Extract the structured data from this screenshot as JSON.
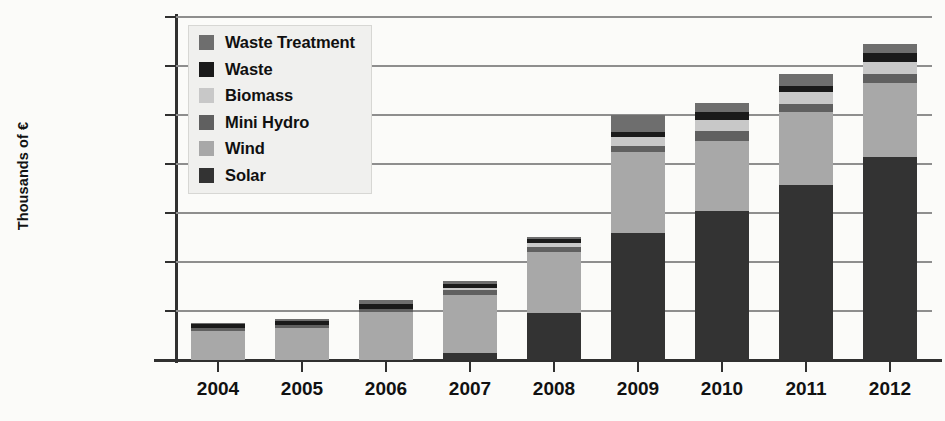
{
  "chart_data": {
    "type": "bar",
    "subtype": "stacked-vertical",
    "title": "",
    "xlabel": "",
    "ylabel": "Thousands of €",
    "categories": [
      "2004",
      "2005",
      "2006",
      "2007",
      "2008",
      "2009",
      "2010",
      "2011",
      "2012"
    ],
    "ylim": [
      0,
      7000000
    ],
    "ytick_values": [
      0,
      1000000,
      2000000,
      3000000,
      4000000,
      5000000,
      6000000,
      7000000
    ],
    "ytick_labels": [
      "0",
      "1000000",
      "2000000",
      "3000000",
      "4000000",
      "5000000",
      "6000000",
      "7000000"
    ],
    "grid": true,
    "grid_axis": "y",
    "legend_position": "upper-left-inside",
    "stack_order_bottom_to_top": [
      "Solar",
      "Wind",
      "Mini Hydro",
      "Biomass",
      "Waste",
      "Waste Treatment"
    ],
    "series": [
      {
        "name": "Solar",
        "color": "#333333",
        "values": [
          0,
          0,
          0,
          150000,
          950000,
          2600000,
          3050000,
          3570000,
          4150000
        ]
      },
      {
        "name": "Wind",
        "color": "#a8a8a8",
        "values": [
          590000,
          660000,
          980000,
          1170000,
          1260000,
          1650000,
          1420000,
          1490000,
          1500000
        ]
      },
      {
        "name": "Mini Hydro",
        "color": "#606060",
        "values": [
          60000,
          60000,
          70000,
          100000,
          100000,
          120000,
          200000,
          160000,
          180000
        ]
      },
      {
        "name": "Biomass",
        "color": "#c8c8c8",
        "values": [
          0,
          0,
          0,
          60000,
          70000,
          180000,
          220000,
          250000,
          250000
        ]
      },
      {
        "name": "Waste",
        "color": "#1a1a1a",
        "values": [
          80000,
          80000,
          90000,
          80000,
          90000,
          100000,
          180000,
          120000,
          190000
        ]
      },
      {
        "name": "Waste Treatment",
        "color": "#6e6e6e",
        "values": [
          30000,
          40000,
          80000,
          60000,
          50000,
          350000,
          180000,
          240000,
          180000
        ]
      }
    ],
    "totals": [
      760000,
      840000,
      1220000,
      1620000,
      2520000,
      5000000,
      5250000,
      5830000,
      6450000
    ]
  },
  "legend": {
    "items": [
      {
        "label": "Waste Treatment",
        "color": "#6e6e6e"
      },
      {
        "label": "Waste",
        "color": "#1a1a1a"
      },
      {
        "label": "Biomass",
        "color": "#c8c8c8"
      },
      {
        "label": "Mini Hydro",
        "color": "#606060"
      },
      {
        "label": "Wind",
        "color": "#a8a8a8"
      },
      {
        "label": "Solar",
        "color": "#333333"
      }
    ]
  }
}
